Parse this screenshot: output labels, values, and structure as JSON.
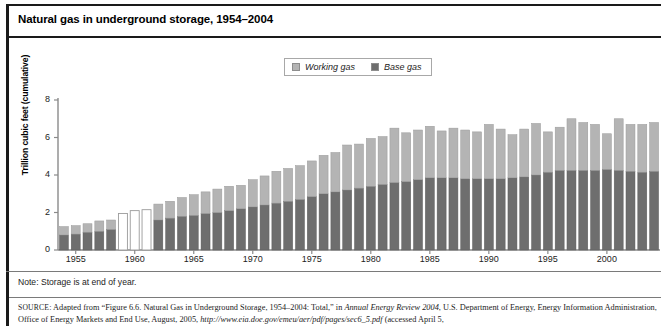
{
  "figure": {
    "title": "Natural gas in underground storage, 1954–2004",
    "note": "Note: Storage is at end of year.",
    "source_prefix": "SOURCE",
    "source_text_1": ": Adapted from “Figure 6.6. Natural Gas in Underground Storage, 1954–2004: Total,” in ",
    "source_italic_1": "Annual Energy Review 2004",
    "source_text_2": ", U.S. Department of Energy, Energy Information Administration, Office of Energy Markets and End Use, August, 2005, ",
    "source_url": "http://www.eia.doe.gov/emeu/aer/pdf/pages/sec6_5.pdf",
    "source_text_3": " (accessed April 5,"
  },
  "legend": {
    "position": "top-center",
    "items": [
      {
        "label": "Working gas",
        "color": "#b4b4b4",
        "name": "working-gas"
      },
      {
        "label": "Base gas",
        "color": "#6e6e6e",
        "name": "base-gas"
      }
    ]
  },
  "chart_data": {
    "type": "bar",
    "stacked": true,
    "title": "Natural gas in underground storage, 1954–2004",
    "xlabel": "",
    "ylabel": "Trillion cubic feet (cumulative)",
    "ylim": [
      0,
      8
    ],
    "yticks": [
      0,
      2,
      4,
      6,
      8
    ],
    "xticks": [
      1955,
      1960,
      1965,
      1970,
      1975,
      1980,
      1985,
      1990,
      1995,
      2000
    ],
    "grid": false,
    "categories": [
      1954,
      1955,
      1956,
      1957,
      1958,
      1959,
      1960,
      1961,
      1962,
      1963,
      1964,
      1965,
      1966,
      1967,
      1968,
      1969,
      1970,
      1971,
      1972,
      1973,
      1974,
      1975,
      1976,
      1977,
      1978,
      1979,
      1980,
      1981,
      1982,
      1983,
      1984,
      1985,
      1986,
      1987,
      1988,
      1989,
      1990,
      1991,
      1992,
      1993,
      1994,
      1995,
      1996,
      1997,
      1998,
      1999,
      2000,
      2001,
      2002,
      2003,
      2004
    ],
    "series": [
      {
        "name": "Base gas",
        "color": "#6e6e6e",
        "values": [
          0.8,
          0.85,
          0.95,
          1.0,
          1.1,
          null,
          null,
          null,
          1.6,
          1.7,
          1.8,
          1.85,
          1.95,
          2.0,
          2.1,
          2.2,
          2.3,
          2.4,
          2.5,
          2.6,
          2.7,
          2.85,
          3.0,
          3.1,
          3.2,
          3.3,
          3.4,
          3.5,
          3.6,
          3.65,
          3.75,
          3.85,
          3.85,
          3.85,
          3.8,
          3.8,
          3.8,
          3.8,
          3.85,
          3.9,
          4.0,
          4.15,
          4.25,
          4.25,
          4.25,
          4.25,
          4.3,
          4.25,
          4.2,
          4.15,
          4.2
        ]
      },
      {
        "name": "Working gas",
        "color": "#b4b4b4",
        "values": [
          0.45,
          0.45,
          0.45,
          0.55,
          0.5,
          null,
          null,
          null,
          0.85,
          0.9,
          1.0,
          1.1,
          1.15,
          1.25,
          1.3,
          1.25,
          1.45,
          1.55,
          1.7,
          1.75,
          1.8,
          1.9,
          2.05,
          2.1,
          2.4,
          2.35,
          2.55,
          2.55,
          2.9,
          2.6,
          2.65,
          2.75,
          2.5,
          2.65,
          2.6,
          2.5,
          2.9,
          2.65,
          2.3,
          2.55,
          2.75,
          2.15,
          2.3,
          2.75,
          2.55,
          2.45,
          1.9,
          2.75,
          2.5,
          2.55,
          2.6
        ]
      }
    ],
    "totals": [
      1.25,
      1.3,
      1.4,
      1.55,
      1.6,
      1.95,
      2.1,
      2.15,
      2.45,
      2.6,
      2.8,
      2.95,
      3.1,
      3.25,
      3.4,
      3.45,
      3.75,
      3.95,
      4.2,
      4.35,
      4.5,
      4.75,
      5.05,
      5.2,
      5.6,
      5.65,
      5.95,
      6.05,
      6.5,
      6.25,
      6.4,
      6.6,
      6.35,
      6.5,
      6.4,
      6.3,
      6.7,
      6.45,
      6.15,
      6.45,
      6.75,
      6.3,
      6.55,
      7.0,
      6.8,
      6.7,
      6.2,
      7.0,
      6.7,
      6.7,
      6.8
    ],
    "missing_data_years": [
      1959,
      1960,
      1961
    ],
    "missing_data_totals": [
      1.95,
      2.1,
      2.15
    ],
    "annotations": [
      "Note: Storage is at end of year."
    ]
  }
}
